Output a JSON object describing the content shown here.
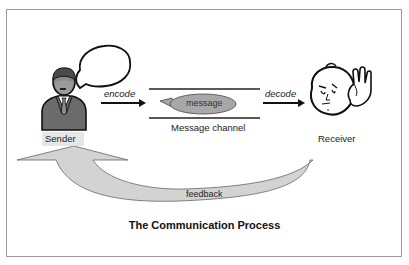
{
  "diagram": {
    "title": "The Communication Process",
    "nodes": {
      "sender": {
        "label": "Sender",
        "icon": "businessman-icon"
      },
      "receiver": {
        "label": "Receiver",
        "icon": "listening-face-icon"
      },
      "message": {
        "label": "message"
      },
      "channel": {
        "label": "Message channel"
      }
    },
    "edges": {
      "encode": {
        "label": "encode",
        "from": "sender",
        "to": "channel"
      },
      "decode": {
        "label": "decode",
        "from": "channel",
        "to": "receiver"
      },
      "feedback": {
        "label": "feedback",
        "from": "receiver",
        "to": "sender"
      }
    },
    "colors": {
      "border": "#9a9a9a",
      "arrow_fill": "#d3d3d3",
      "message_fill": "#a8a8a8",
      "suit": "#6b6b6b",
      "stroke": "#111111"
    }
  }
}
